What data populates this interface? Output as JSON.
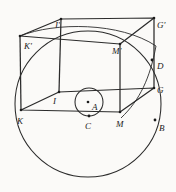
{
  "figure": {
    "background_color": "#fbfaf8",
    "stroke_color": "#2b2b2b",
    "label_color": "#1b1b1b"
  },
  "labels": {
    "i_prime": "I'",
    "g_prime": "G'",
    "k_prime": "K'",
    "m_prime": "M'",
    "d": "D",
    "g": "G",
    "b": "B",
    "i": "I",
    "a": "A",
    "c": "C",
    "k": "K",
    "m": "M"
  },
  "label_positions": {
    "i_prime": {
      "x": 55,
      "y": 21
    },
    "g_prime": {
      "x": 157,
      "y": 21
    },
    "k_prime": {
      "x": 24,
      "y": 42
    },
    "m_prime": {
      "x": 114,
      "y": 47
    },
    "d": {
      "x": 157,
      "y": 62
    },
    "g": {
      "x": 157,
      "y": 86
    },
    "b": {
      "x": 159,
      "y": 124
    },
    "i": {
      "x": 54,
      "y": 97
    },
    "a": {
      "x": 92,
      "y": 104
    },
    "c": {
      "x": 86,
      "y": 123
    },
    "k": {
      "x": 17,
      "y": 118
    },
    "m": {
      "x": 117,
      "y": 121
    }
  },
  "geometry": {
    "big_circle": {
      "cx": 88,
      "cy": 104,
      "r": 73
    },
    "small_circle": {
      "cx": 89,
      "cy": 102,
      "r": 14
    },
    "center_dot": {
      "cx": 88,
      "cy": 102,
      "r": 1.3
    },
    "point_d": {
      "cx": 152,
      "cy": 60,
      "r": 1.4
    },
    "point_b": {
      "cx": 155,
      "cy": 120,
      "r": 1.4
    },
    "point_c": {
      "cx": 89,
      "cy": 116,
      "r": 1.4
    },
    "vertices": {
      "I_prime": {
        "x": 61,
        "y": 19
      },
      "G_prime": {
        "x": 154,
        "y": 18
      },
      "K_prime": {
        "x": 20,
        "y": 36
      },
      "M_prime": {
        "x": 120,
        "y": 44
      },
      "I": {
        "x": 59,
        "y": 92
      },
      "G": {
        "x": 154,
        "y": 88
      },
      "K": {
        "x": 21,
        "y": 110
      },
      "M": {
        "x": 120,
        "y": 112
      }
    },
    "arc_sphere_equator": "M 20 36 Q 88 26 154 44",
    "arc_sphere_meridian": "M 154 44 Q 150 95 120 118"
  }
}
